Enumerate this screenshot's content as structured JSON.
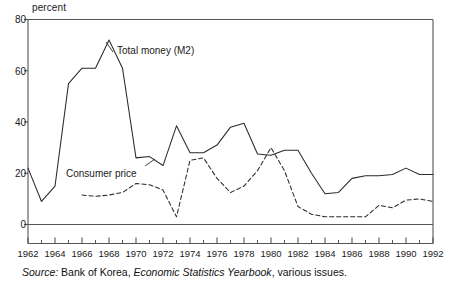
{
  "chart_data": {
    "type": "line",
    "title": "",
    "subtitle": "",
    "xlabel": "",
    "ylabel": "percent",
    "ylim": [
      0,
      80
    ],
    "xlim": [
      1962,
      1992
    ],
    "grid": false,
    "legend_position": "inline-annotation",
    "y_ticks": [
      0,
      20,
      40,
      60,
      80
    ],
    "x_ticks": [
      1962,
      1964,
      1966,
      1968,
      1970,
      1972,
      1974,
      1976,
      1978,
      1980,
      1982,
      1984,
      1986,
      1988,
      1990,
      1992
    ],
    "x_minor_ticks": [
      1963,
      1965,
      1967,
      1969,
      1971,
      1973,
      1975,
      1977,
      1979,
      1981,
      1983,
      1985,
      1987,
      1989,
      1991
    ],
    "x": [
      1962,
      1963,
      1964,
      1965,
      1966,
      1967,
      1968,
      1969,
      1970,
      1971,
      1972,
      1973,
      1974,
      1975,
      1976,
      1977,
      1978,
      1979,
      1980,
      1981,
      1982,
      1983,
      1984,
      1985,
      1986,
      1987,
      1988,
      1989,
      1990,
      1991,
      1992
    ],
    "series": [
      {
        "name": "Total money (M2)",
        "style": "solid",
        "color": "#2b2b2b",
        "values": [
          22,
          9,
          15,
          55,
          61,
          61,
          72,
          61,
          26,
          26.5,
          23,
          38.5,
          28,
          28,
          31,
          38,
          39.5,
          27.5,
          27,
          29,
          29,
          20,
          12,
          12.5,
          18,
          19,
          19,
          19.5,
          22,
          19.5,
          19.5
        ]
      },
      {
        "name": "Consumer price",
        "style": "dashed",
        "color": "#2b2b2b",
        "values": [
          null,
          null,
          null,
          null,
          11.5,
          11,
          11.5,
          12.5,
          16,
          15.5,
          13.5,
          3,
          25,
          26,
          18,
          12.5,
          15,
          21,
          30,
          21,
          7,
          4,
          3,
          3,
          3,
          3,
          7.5,
          6.5,
          9.5,
          10,
          9
        ]
      }
    ],
    "annotations": [
      {
        "text": "Total money (M2)",
        "x": 1967.5,
        "y": 66
      },
      {
        "text": "Consumer price",
        "x": 1964.5,
        "y": 20
      }
    ]
  },
  "axis": {
    "y_unit_label": "percent",
    "y_tick_labels": [
      "0",
      "20",
      "40",
      "60",
      "80"
    ],
    "x_tick_labels": [
      "1962",
      "1964",
      "1966",
      "1968",
      "1970",
      "1972",
      "1974",
      "1976",
      "1978",
      "1980",
      "1982",
      "1984",
      "1986",
      "1988",
      "1990",
      "1992"
    ]
  },
  "annotations": {
    "m2_label": "Total money (M2)",
    "cpi_label": "Consumer price"
  },
  "source": {
    "prefix": "Source:",
    "publisher": " Bank of Korea, ",
    "work": "Economic Statistics Yearbook",
    "suffix": ", various issues."
  },
  "colors": {
    "line": "#2b2b2b",
    "axis": "#555555",
    "text": "#1a1a1a",
    "background": "#ffffff"
  }
}
